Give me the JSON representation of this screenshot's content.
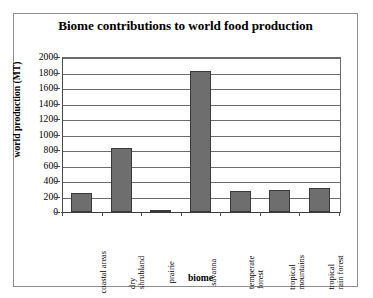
{
  "chart_data": {
    "type": "bar",
    "title": "Biome contributions to world food production",
    "xlabel": "biome",
    "ylabel": "world production (MT)",
    "categories": [
      "coastal areas",
      "dry shrubland",
      "prairie",
      "savanna",
      "temperate forest",
      "tropical mountains",
      "tropical rain forest"
    ],
    "category_lines": [
      [
        "coastal areas"
      ],
      [
        "dry",
        "shrubland"
      ],
      [
        "prairie"
      ],
      [
        "savanna"
      ],
      [
        "temperate",
        "forest"
      ],
      [
        "tropical",
        "mountains"
      ],
      [
        "tropical",
        "rain forest"
      ]
    ],
    "values": [
      240,
      830,
      20,
      1825,
      275,
      290,
      310
    ],
    "ylim": [
      0,
      2000
    ],
    "ytick_step": 200,
    "yticks": [
      2000,
      1800,
      1600,
      1400,
      1200,
      1000,
      800,
      600,
      400,
      200,
      0
    ],
    "ytick_labels": [
      "2000",
      "1800",
      "1600",
      "1400",
      "1200",
      "1000",
      "800",
      "600",
      "400",
      "200",
      "0"
    ],
    "grid": true,
    "legend": false,
    "bar_color": "#6e6e6e",
    "bar_border_color": "#3a3a3a",
    "gridline_color": "#6b6b6b",
    "axis_color": "#3b3b3b",
    "frame_color": "#8e8e8e",
    "background": "#ffffff"
  }
}
